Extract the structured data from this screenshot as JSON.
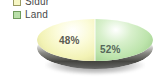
{
  "chart_data": {
    "type": "pie",
    "title": "",
    "categories": [
      "Sidur",
      "Land"
    ],
    "values": [
      48,
      52
    ],
    "labels": [
      "48%",
      "52%"
    ],
    "colors": [
      "#f7f7c4",
      "#b9dfa9"
    ],
    "legend_position": "top-left",
    "three_d": true,
    "unit": "%"
  },
  "legend": {
    "items": [
      {
        "label": "Sidur",
        "color": "#f7f7c4",
        "swatch": "legend-swatch-yellow"
      },
      {
        "label": "Land",
        "color": "#b9dfa9",
        "swatch": "legend-swatch-green"
      }
    ]
  },
  "pie": {
    "slice_left_label": "48%",
    "slice_right_label": "52%"
  }
}
